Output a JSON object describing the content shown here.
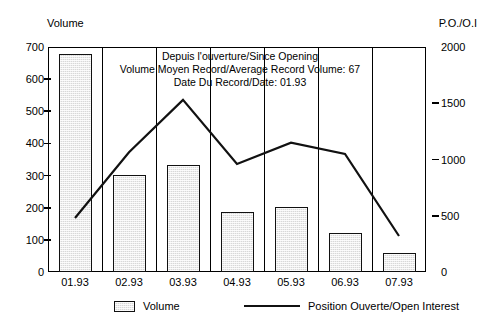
{
  "axes": {
    "left_caption": "Volume",
    "right_caption": "P.O./O.I"
  },
  "annotation": {
    "line1": "Depuis l'ouverture/Since Opening",
    "line2": "Volume Moyen Record/Average Record Volume:   67",
    "line3": "Date Du Record/Date:   01.93"
  },
  "legend": {
    "volume_label": "Volume",
    "open_interest_label": "Position Ouverte/Open Interest"
  },
  "chart_data": {
    "type": "bar",
    "title": "",
    "subtitle": "",
    "xlabel": "",
    "ylabel": "Volume",
    "y2label": "P.O./O.I",
    "categories": [
      "01.93",
      "02.93",
      "03.93",
      "04.93",
      "05.93",
      "06.93",
      "07.93"
    ],
    "ylim": [
      0,
      700
    ],
    "y2lim": [
      0,
      2000
    ],
    "yticks": [
      0,
      100,
      200,
      300,
      400,
      500,
      600,
      700
    ],
    "y2ticks": [
      0,
      500,
      1000,
      1500,
      2000
    ],
    "grid": false,
    "legend_position": "bottom",
    "series": [
      {
        "name": "Volume",
        "type": "bar",
        "axis": "left",
        "values": [
          678,
          303,
          333,
          188,
          202,
          121,
          59
        ]
      },
      {
        "name": "Position Ouverte/Open Interest",
        "type": "line",
        "axis": "right",
        "values": [
          480,
          1065,
          1530,
          960,
          1150,
          1050,
          320
        ]
      }
    ],
    "annotations": [
      "Depuis l'ouverture/Since Opening",
      "Volume Moyen Record/Average Record Volume:   67",
      "Date Du Record/Date:   01.93"
    ]
  },
  "colors": {
    "bar_fill": "#d8d8d8",
    "bar_stroke": "#111111",
    "line_stroke": "#111111",
    "frame": "#000000",
    "background": "#ffffff"
  }
}
